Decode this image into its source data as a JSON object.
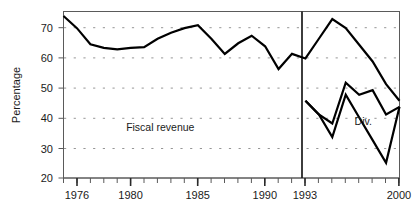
{
  "chart_data": {
    "type": "line",
    "title": "",
    "subtitle": "",
    "xlabel": "",
    "ylabel": "Percentage",
    "xlim": [
      1975,
      2000
    ],
    "ylim": [
      20,
      75
    ],
    "grid": "horizontal-dashed",
    "legend_position": "inline-annotations",
    "y_ticks": [
      20,
      30,
      40,
      50,
      60,
      70
    ],
    "y_tick_labels": [
      "20",
      "30",
      "40",
      "50",
      "60",
      "70"
    ],
    "x_ticks": [
      1975,
      1976,
      1977,
      1978,
      1979,
      1980,
      1981,
      1982,
      1983,
      1984,
      1985,
      1986,
      1987,
      1988,
      1989,
      1990,
      1991,
      1992,
      1993,
      1994,
      1995,
      1996,
      1997,
      1998,
      1999,
      2000
    ],
    "x_tick_labels_shown": [
      "1976",
      "1980",
      "1985",
      "1990",
      "1993",
      "2000"
    ],
    "x_labeled_ticks": [
      1976,
      1980,
      1985,
      1990,
      1993,
      2000
    ],
    "reference_line": {
      "x": 1993,
      "label": "1993",
      "style": "solid-vertical"
    },
    "annotations": [
      {
        "text": "Fiscal revenue",
        "x": 1982.2,
        "y": 35.5
      },
      {
        "text": "Div.",
        "x": 1997.3,
        "y": 37.5
      }
    ],
    "series": [
      {
        "name": "Fiscal revenue",
        "x": [
          1975,
          1976,
          1977,
          1978,
          1979,
          1980,
          1981,
          1982,
          1983,
          1984,
          1985,
          1986,
          1987,
          1988,
          1989,
          1990,
          1991,
          1992,
          1993,
          1994,
          1995,
          1996,
          1997,
          1998,
          1999,
          2000
        ],
        "values": [
          73.5,
          69.5,
          64.2,
          63.0,
          62.5,
          63.0,
          63.2,
          66.0,
          68.0,
          69.5,
          70.5,
          66.0,
          61.0,
          64.5,
          67.0,
          63.5,
          56.0,
          61.0,
          59.5,
          66.0,
          72.5,
          69.5,
          64.0,
          58.5,
          51.0,
          45.5
        ]
      },
      {
        "name": "Upper post-reform series",
        "x": [
          1993,
          1994,
          1995,
          1996,
          1997,
          1998,
          1999,
          2000
        ],
        "values": [
          45.5,
          41.0,
          38.0,
          51.5,
          47.5,
          49.0,
          41.0,
          43.5
        ]
      },
      {
        "name": "Div.",
        "x": [
          1993,
          1994,
          1995,
          1996,
          1997,
          1998,
          1999,
          2000
        ],
        "values": [
          45.5,
          41.0,
          33.5,
          47.5,
          40.0,
          32.5,
          25.0,
          43.5
        ]
      }
    ]
  },
  "axis": {
    "y_title": "Percentage",
    "y_tick_0": "20",
    "y_tick_1": "30",
    "y_tick_2": "40",
    "y_tick_3": "50",
    "y_tick_4": "60",
    "y_tick_5": "70",
    "x_tick_0": "1976",
    "x_tick_1": "1980",
    "x_tick_2": "1985",
    "x_tick_3": "1990",
    "x_tick_4": "1993",
    "x_tick_5": "2000"
  },
  "labels": {
    "fiscal_revenue": "Fiscal revenue",
    "div": "Div."
  },
  "colors": {
    "line": "#000000",
    "frame": "#5a5a5a",
    "grid": "#7a7a7a",
    "background": "#ffffff",
    "text": "#1a1a1a"
  }
}
